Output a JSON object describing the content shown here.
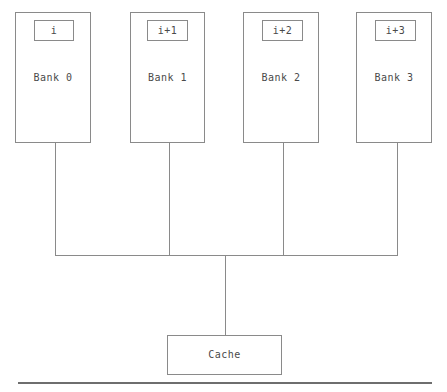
{
  "diagram": {
    "stroke_color": "#8a8a8a",
    "text_color": "#4a4a4a",
    "rule_color": "#6e6e6e",
    "background_color": "#ffffff",
    "banks": [
      {
        "index_label": "i",
        "name_label": "Bank 0"
      },
      {
        "index_label": "i+1",
        "name_label": "Bank 1"
      },
      {
        "index_label": "i+2",
        "name_label": "Bank 2"
      },
      {
        "index_label": "i+3",
        "name_label": "Bank 3"
      }
    ],
    "cache": {
      "label": "Cache"
    }
  }
}
